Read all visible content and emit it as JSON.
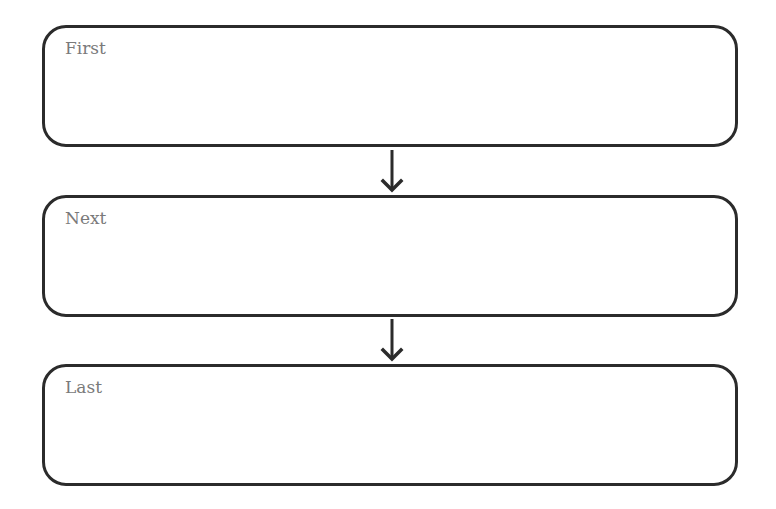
{
  "diagram": {
    "type": "sequence-flowchart",
    "boxes": [
      {
        "label": "First"
      },
      {
        "label": "Next"
      },
      {
        "label": "Last"
      }
    ],
    "connectors": [
      {
        "from": "First",
        "to": "Next",
        "direction": "down"
      },
      {
        "from": "Next",
        "to": "Last",
        "direction": "down"
      }
    ],
    "colors": {
      "stroke": "#2b2b2b",
      "label": "#7a7a7a",
      "background": "#ffffff"
    }
  }
}
